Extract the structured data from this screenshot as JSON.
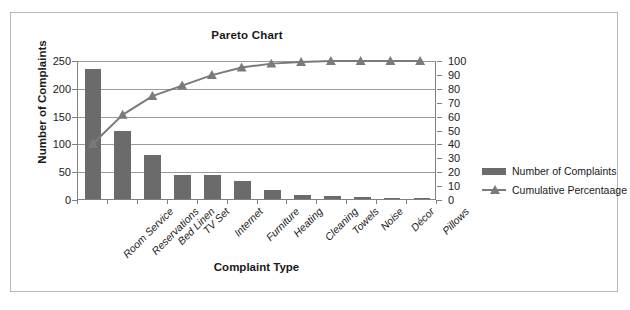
{
  "chart_data": {
    "type": "bar",
    "title": "Pareto Chart",
    "xlabel": "Complaint Type",
    "ylabel": "Number of Complaints",
    "y2label": "Cumulative Percentaage",
    "categories": [
      "Room Service",
      "Reservations",
      "Bed Linen",
      "TV Set",
      "Internet",
      "Furniture",
      "Heating",
      "Cleaning",
      "Towels",
      "Noise",
      "Décor",
      "Pillows"
    ],
    "series": [
      {
        "name": "Number of Complaints",
        "type": "bar",
        "axis": "left",
        "color": "#6b6b6b",
        "values": [
          233,
          122,
          79,
          44,
          44,
          32,
          16,
          7,
          5,
          3,
          2,
          1
        ]
      },
      {
        "name": "Cumulative Percentaage",
        "type": "line",
        "axis": "right",
        "color": "#7a7a7a",
        "marker": "triangle",
        "values": [
          40.0,
          61.0,
          74.6,
          82.2,
          89.8,
          95.3,
          98.1,
          99.3,
          100.0,
          100.0,
          100.0,
          100.0
        ]
      }
    ],
    "ylim": [
      0,
      250
    ],
    "yticks": [
      0,
      50,
      100,
      150,
      200,
      250
    ],
    "y2lim": [
      0,
      100
    ],
    "y2ticks": [
      0,
      10,
      20,
      30,
      40,
      50,
      60,
      70,
      80,
      90,
      100
    ],
    "grid": true,
    "legend_position": "right"
  },
  "legend": {
    "entries": [
      {
        "label": "Number of Complaints",
        "marker": "bar-swatch"
      },
      {
        "label": "Cumulative Percentaage",
        "marker": "line-triangle"
      }
    ]
  }
}
